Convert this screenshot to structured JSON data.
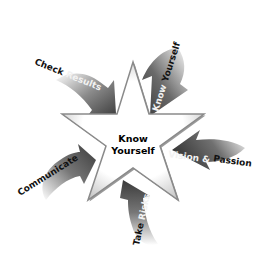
{
  "diagram": {
    "center": {
      "line1": "Know",
      "line2": "Yourself"
    },
    "arrows": [
      {
        "part1": "Know ",
        "part2": "Yourself",
        "position": "top-right"
      },
      {
        "part1": "Vision ",
        "amp": "&",
        "part2": " Passion",
        "position": "right"
      },
      {
        "part1": "Take ",
        "part2": "Risks",
        "position": "bottom"
      },
      {
        "part1": "Communicate",
        "position": "left"
      },
      {
        "part1": "Check ",
        "part2": "Results",
        "position": "top-left"
      }
    ],
    "colors": {
      "arrow_dark": "#3a3a3a",
      "arrow_fade": "#ffffff",
      "star_fill": "#ffffff",
      "star_edge": "#8a8a8a",
      "text": "#111111"
    }
  }
}
